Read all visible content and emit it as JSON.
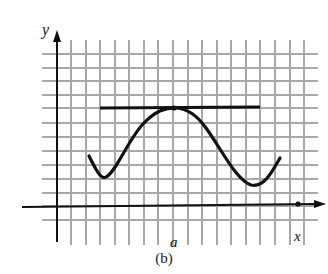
{
  "figure": {
    "caption": "(b)",
    "axis_labels": {
      "x": "x",
      "y": "y"
    },
    "tick_label": "a",
    "colors": {
      "grid": "#a8a8a8",
      "curve": "#111111",
      "axes": "#111111",
      "background": "#ffffff"
    }
  },
  "diagram": {
    "elements": [
      "grid",
      "x-axis",
      "y-axis",
      "curve",
      "horizontal-tangent-line",
      "point-of-tangency",
      "point-x"
    ]
  }
}
